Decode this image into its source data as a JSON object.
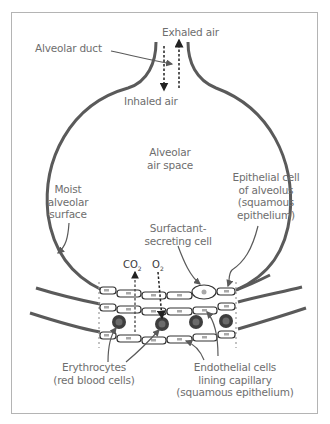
{
  "diagram": {
    "colors": {
      "outline": "#5a5a5a",
      "label_text": "#6e6e6e",
      "frame": "#b4b4b4",
      "rbc_fill": "#4a4a4a",
      "nucleus": "#a8a8a8"
    },
    "labels": {
      "exhaled_air": "Exhaled air",
      "alveolar_duct": "Alveolar duct",
      "inhaled_air": "Inhaled air",
      "alveolar_air_space_1": "Alveolar",
      "alveolar_air_space_2": "air space",
      "moist_1": "Moist",
      "moist_2": "alveolar",
      "moist_3": "surface",
      "epithelial_1": "Epithelial cell",
      "epithelial_2": "of alveolus",
      "epithelial_3": "(squamous",
      "epithelial_4": "epithelium)",
      "surfactant_1": "Surfactant-",
      "surfactant_2": "secreting cell",
      "co2": "CO",
      "co2_sub": "2",
      "o2": "O",
      "o2_sub": "2",
      "erythrocytes_1": "Erythrocytes",
      "erythrocytes_2": "(red blood cells)",
      "endothelial_1": "Endothelial cells",
      "endothelial_2": "lining capillary",
      "endothelial_3": "(squamous epithelium)"
    }
  }
}
